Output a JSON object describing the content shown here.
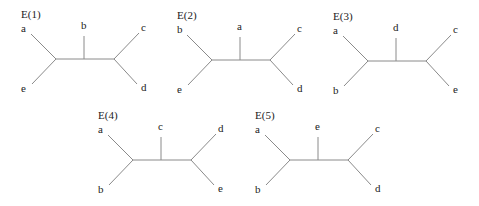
{
  "diagram": {
    "trees": [
      {
        "title": "E(1)",
        "ox": 0,
        "oy": 0,
        "leaves": {
          "top_left": "a",
          "bottom_left": "e",
          "middle": "b",
          "top_right": "c",
          "bottom_right": "d"
        }
      },
      {
        "title": "E(2)",
        "ox": 156,
        "oy": 1,
        "leaves": {
          "top_left": "b",
          "bottom_left": "e",
          "middle": "a",
          "top_right": "c",
          "bottom_right": "d"
        }
      },
      {
        "title": "E(3)",
        "ox": 312,
        "oy": 2,
        "leaves": {
          "top_left": "a",
          "bottom_left": "b",
          "middle": "d",
          "top_right": "c",
          "bottom_right": "e"
        }
      },
      {
        "title": "E(4)",
        "ox": 77,
        "oy": 101,
        "leaves": {
          "top_left": "a",
          "bottom_left": "b",
          "middle": "c",
          "top_right": "d",
          "bottom_right": "e"
        }
      },
      {
        "title": "E(5)",
        "ox": 234,
        "oy": 101,
        "leaves": {
          "top_left": "a",
          "bottom_left": "b",
          "middle": "e",
          "top_right": "c",
          "bottom_right": "d"
        }
      }
    ]
  }
}
